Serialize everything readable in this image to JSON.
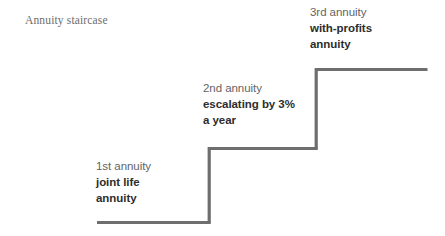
{
  "figure": {
    "title": "Annuity staircase",
    "background_color": "#ffffff",
    "line_color": "#6e6e6e",
    "index_text_color": "#646464",
    "desc_text_color": "#2d2d2d",
    "title_text_color": "#6d6d6d"
  },
  "chart_data": {
    "type": "line",
    "title": "Annuity staircase",
    "subtitle": "",
    "xlabel": "",
    "ylabel": "",
    "grid": false,
    "legend_position": "none",
    "categories": [
      "1st annuity",
      "2nd annuity",
      "3rd annuity"
    ],
    "values": [
      1,
      2,
      3
    ],
    "steps": [
      {
        "index": 1,
        "index_label": "1st annuity",
        "description_lines": [
          "joint life",
          "annuity"
        ],
        "tread_start_x": 97,
        "tread_end_x": 210,
        "tread_y": 222,
        "height_rank": 1
      },
      {
        "index": 2,
        "index_label": "2nd annuity",
        "description_lines": [
          "escalating by 3%",
          "a year"
        ],
        "tread_start_x": 209,
        "tread_end_x": 317,
        "tread_y": 148,
        "height_rank": 2
      },
      {
        "index": 3,
        "index_label": "3rd annuity",
        "description_lines": [
          "with-profits",
          "annuity"
        ],
        "tread_start_x": 316,
        "tread_end_x": 427,
        "tread_y": 69,
        "height_rank": 3
      }
    ],
    "annotations": [
      {
        "id": "step-1",
        "lines": [
          "1st annuity",
          "joint life",
          "annuity"
        ]
      },
      {
        "id": "step-2",
        "lines": [
          "2nd annuity",
          "escalating by 3%",
          "a year"
        ]
      },
      {
        "id": "step-3",
        "lines": [
          "3rd annuity",
          "with-profits",
          "annuity"
        ]
      }
    ],
    "path_points": [
      [
        97,
        222
      ],
      [
        210,
        222
      ],
      [
        210,
        148
      ],
      [
        317,
        148
      ],
      [
        317,
        69
      ],
      [
        427,
        69
      ]
    ]
  },
  "labels": {
    "step1": {
      "index": "1st annuity",
      "line1": "joint life",
      "line2": "annuity"
    },
    "step2": {
      "index": "2nd annuity",
      "line1": "escalating by 3%",
      "line2": "a year"
    },
    "step3": {
      "index": "3rd annuity",
      "line1": "with-profits",
      "line2": "annuity"
    }
  }
}
